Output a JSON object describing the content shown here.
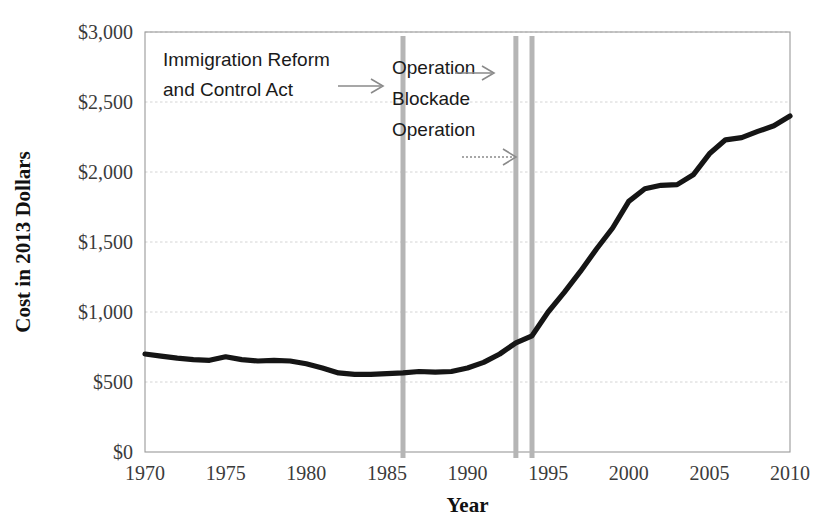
{
  "chart_data": {
    "type": "line",
    "title": "",
    "xlabel": "Year",
    "ylabel": "Cost in 2013 Dollars",
    "xlim": [
      1970,
      2010
    ],
    "ylim": [
      0,
      3000
    ],
    "grid": true,
    "legend_position": "none",
    "xticks": [
      "1970",
      "1975",
      "1980",
      "1985",
      "1990",
      "1995",
      "2000",
      "2005",
      "2010"
    ],
    "xtick_values": [
      1970,
      1975,
      1980,
      1985,
      1990,
      1995,
      2000,
      2005,
      2010
    ],
    "yticks": [
      "$0",
      "$500",
      "$1,000",
      "$1,500",
      "$2,000",
      "$2,500",
      "$3,000"
    ],
    "ytick_values": [
      0,
      500,
      1000,
      1500,
      2000,
      2500,
      3000
    ],
    "series": [
      {
        "name": "Cost in 2013 Dollars",
        "color": "#151515",
        "x": [
          1970,
          1971,
          1972,
          1973,
          1974,
          1975,
          1976,
          1977,
          1978,
          1979,
          1980,
          1981,
          1982,
          1983,
          1984,
          1985,
          1986,
          1987,
          1988,
          1989,
          1990,
          1991,
          1992,
          1993,
          1994,
          1995,
          1996,
          1997,
          1998,
          1999,
          2000,
          2001,
          2002,
          2003,
          2004,
          2005,
          2006,
          2007,
          2008,
          2009,
          2010
        ],
        "values": [
          700,
          685,
          670,
          660,
          655,
          680,
          660,
          650,
          655,
          650,
          630,
          600,
          565,
          555,
          555,
          560,
          565,
          575,
          570,
          575,
          600,
          640,
          700,
          780,
          830,
          1000,
          1140,
          1290,
          1450,
          1600,
          1790,
          1880,
          1905,
          1910,
          1980,
          2130,
          2230,
          2245,
          2290,
          2330,
          2400
        ]
      }
    ],
    "vertical_markers": [
      {
        "year": 1986,
        "color": "#b5b5b5"
      },
      {
        "year": 1993,
        "color": "#b5b5b5"
      },
      {
        "year": 1994,
        "color": "#b5b5b5"
      }
    ],
    "annotations": [
      {
        "id": "immigration-reform",
        "lines": [
          "Immigration Reform",
          "and Control Act"
        ],
        "points_to_year": 1986
      },
      {
        "id": "operation-blockade",
        "lines": [
          "Operation",
          "Blockade",
          "Operation"
        ],
        "points_to_year": 1993
      }
    ]
  },
  "axes": {
    "y_title": "Cost in 2013 Dollars",
    "x_title": "Year"
  }
}
